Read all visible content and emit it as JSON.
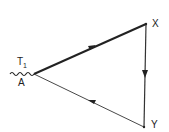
{
  "diagram": {
    "nodes": [
      {
        "id": "A",
        "label": "A",
        "x": 34,
        "y": 74
      },
      {
        "id": "X",
        "label": "X",
        "x": 146,
        "y": 24
      },
      {
        "id": "Y",
        "label": "Y",
        "x": 144,
        "y": 127
      }
    ],
    "edges": [
      {
        "from": "A",
        "to": "X",
        "style": "thick",
        "arrow": "forward"
      },
      {
        "from": "X",
        "to": "Y",
        "style": "normal",
        "arrow": "forward"
      },
      {
        "from": "Y",
        "to": "A",
        "style": "thin",
        "arrow": "forward"
      }
    ],
    "annotations": {
      "t1": "T",
      "t1_sub": "1"
    },
    "labels": {
      "A": "A",
      "X": "X",
      "Y": "Y"
    },
    "colors": {
      "line": "#222222",
      "background": "#ffffff"
    }
  }
}
